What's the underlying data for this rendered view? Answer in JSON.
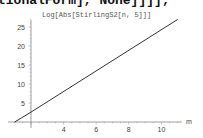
{
  "code_fragment": "tionalForm], None]]]];",
  "chart_data": {
    "type": "line",
    "title": "Log[Abs[StirlingS2[n, 5]]]",
    "xlabel": "m",
    "ylabel": "",
    "x_ticks": [
      4,
      6,
      8,
      10
    ],
    "y_ticks": [
      5,
      10,
      15,
      20,
      25
    ],
    "x_origin": 2,
    "y_origin": 0,
    "xlim": [
      1,
      11.5
    ],
    "ylim": [
      0,
      27
    ],
    "grid": false,
    "series": [
      {
        "name": "Log[Abs[StirlingS2[n, 5]]]",
        "x": [
          1,
          2,
          11
        ],
        "y": [
          0,
          2.6,
          27
        ]
      }
    ],
    "line_color": "#333333",
    "axis_color": "#888888"
  }
}
